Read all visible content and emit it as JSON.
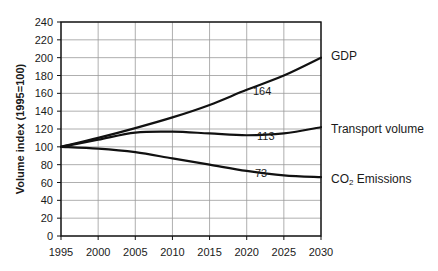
{
  "chart_data": {
    "type": "line",
    "title": "",
    "xlabel": "",
    "ylabel": "Volume index (1995=100)",
    "x": [
      1995,
      2000,
      2005,
      2010,
      2015,
      2020,
      2025,
      2030
    ],
    "xlim": [
      1995,
      2030
    ],
    "ylim": [
      0,
      240
    ],
    "x_ticks": [
      "1995",
      "2000",
      "2005",
      "2010",
      "2015",
      "2020",
      "2025",
      "2030"
    ],
    "y_ticks": [
      "0",
      "20",
      "40",
      "60",
      "80",
      "100",
      "120",
      "140",
      "160",
      "180",
      "200",
      "220",
      "240"
    ],
    "grid": true,
    "legend_position": "right (direct labels at line ends)",
    "series": [
      {
        "name": "GDP",
        "values": [
          100,
          110,
          121,
          133,
          147,
          164,
          180,
          200
        ]
      },
      {
        "name": "Transport volume",
        "values": [
          100,
          108,
          116,
          117,
          115,
          113,
          115,
          122
        ]
      },
      {
        "name": "CO2 Emissions",
        "display_name": "CO₂ Emissions",
        "values": [
          100,
          98,
          94,
          87,
          80,
          73,
          68,
          66
        ]
      }
    ],
    "annotations": [
      {
        "text": "164",
        "x": 2020,
        "series": "GDP"
      },
      {
        "text": "113",
        "x": 2020,
        "series": "Transport volume"
      },
      {
        "text": "73",
        "x": 2020,
        "series": "CO2 Emissions"
      }
    ]
  },
  "labels": {
    "ylabel": "Volume index (1995=100)",
    "gdp": "GDP",
    "transport": "Transport volume",
    "co2_prefix": "CO",
    "co2_sub": "2",
    "co2_suffix": " Emissions",
    "annot_gdp": "164",
    "annot_transport": "113",
    "annot_co2": "73"
  },
  "colors": {
    "line": "#111111",
    "grid": "#9a9a9a",
    "background": "#ffffff"
  }
}
